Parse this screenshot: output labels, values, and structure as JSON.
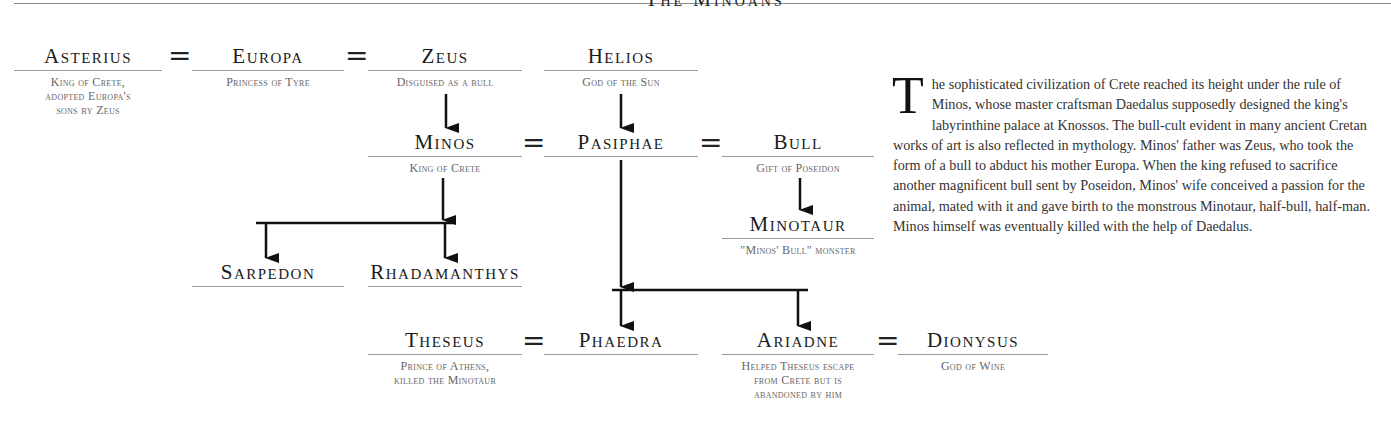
{
  "page_heading": "The Minoans",
  "people": {
    "asterius": {
      "name": "Asterius",
      "desc": [
        "King of Crete,",
        "adopted Europa's",
        "sons by Zeus"
      ]
    },
    "europa": {
      "name": "Europa",
      "desc": [
        "Princess of Tyre"
      ]
    },
    "zeus": {
      "name": "Zeus",
      "desc": [
        "Disguised as a bull"
      ]
    },
    "helios": {
      "name": "Helios",
      "desc": [
        "God of the Sun"
      ]
    },
    "minos": {
      "name": "Minos",
      "desc": [
        "King of Crete"
      ]
    },
    "pasiphae": {
      "name": "Pasiphae",
      "desc": []
    },
    "bull": {
      "name": "Bull",
      "desc": [
        "Gift of Poseidon"
      ]
    },
    "minotaur": {
      "name": "Minotaur",
      "desc": [
        "\"Minos' Bull\" monster"
      ]
    },
    "sarpedon": {
      "name": "Sarpedon",
      "desc": []
    },
    "rhadamanthys": {
      "name": "Rhadamanthys",
      "desc": []
    },
    "theseus": {
      "name": "Theseus",
      "desc": [
        "Prince of Athens,",
        "killed the Minotaur"
      ]
    },
    "phaedra": {
      "name": "Phaedra",
      "desc": []
    },
    "ariadne": {
      "name": "Ariadne",
      "desc": [
        "Helped Theseus escape",
        "from Crete but is",
        "abandoned by him"
      ]
    },
    "dionysus": {
      "name": "Dionysus",
      "desc": [
        "God of Wine"
      ]
    }
  },
  "marriage_symbol": "=",
  "prose": {
    "dropcap": "T",
    "text": "he sophisticated civilization of Crete reached its height under the rule of Minos, whose master craftsman Daedalus supposedly designed the king's labyrinthine palace at Knossos. The bull-cult evident in many ancient Cretan works of art is also reflected in mythology. Minos' father was Zeus, who took the form of a bull to abduct his mother Europa. When the king refused to sacrifice another magnificent bull sent by Poseidon, Minos' wife conceived a passion for the animal, mated with it and gave birth to the monstrous Minotaur, half-bull, half-man. Minos himself was eventually killed with the help of Daedalus."
  },
  "colors": {
    "ink": "#1a1a1a",
    "caption": "#666666",
    "rule": "#9a9a9a"
  }
}
